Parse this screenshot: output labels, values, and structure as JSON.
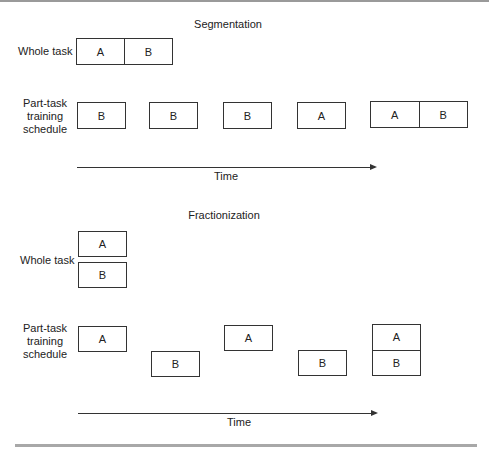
{
  "segmentation": {
    "title": "Segmentation",
    "whole_task_label": "Whole task",
    "whole_task": [
      "A",
      "B"
    ],
    "schedule_label": [
      "Part-task",
      "training",
      "schedule"
    ],
    "schedule": [
      [
        "B"
      ],
      [
        "B"
      ],
      [
        "B"
      ],
      [
        "A"
      ],
      [
        "A",
        "B"
      ]
    ],
    "axis_label": "Time"
  },
  "fractionization": {
    "title": "Fractionization",
    "whole_task_label": "Whole task",
    "whole_task": [
      "A",
      "B"
    ],
    "schedule_label": [
      "Part-task",
      "training",
      "schedule"
    ],
    "schedule": [
      [
        "A"
      ],
      [
        "B"
      ],
      [
        "A"
      ],
      [
        "B"
      ],
      [
        "A",
        "B"
      ]
    ],
    "axis_label": "Time"
  }
}
